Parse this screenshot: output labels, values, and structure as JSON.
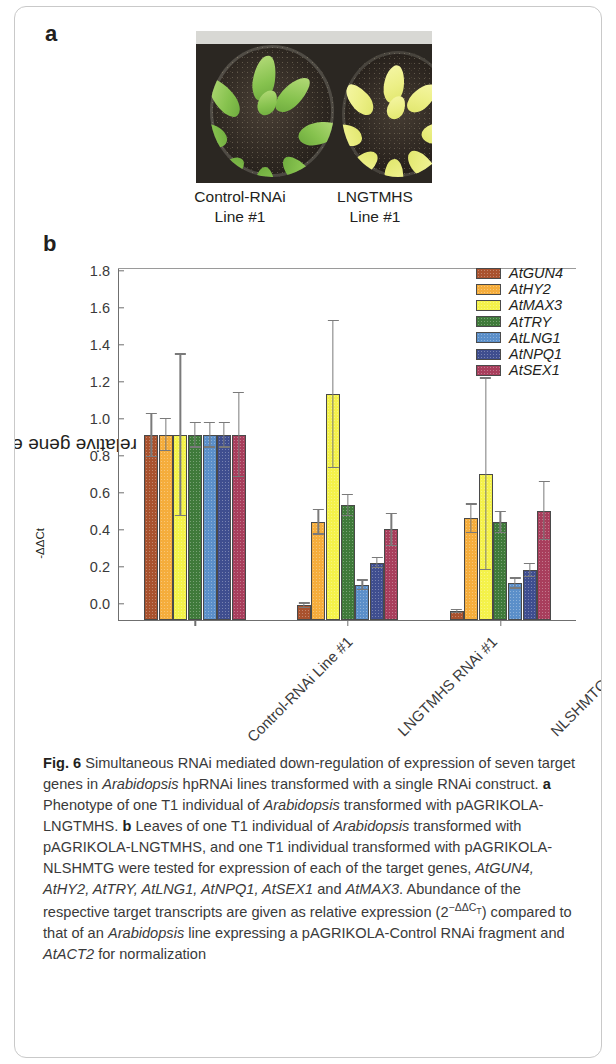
{
  "panels": {
    "a_letter": "a",
    "b_letter": "b"
  },
  "photo": {
    "left_label": "Control-RNAi\nLine #1",
    "left_label_line1": "Control-RNAi",
    "left_label_line2": "Line #1",
    "right_label_line1": "LNGTMHS",
    "right_label_line2": "Line #1"
  },
  "chart_data": {
    "type": "bar",
    "title": "",
    "xlabel": "",
    "ylabel": "relative gene expression [2-ΔΔCt]",
    "ylabel_base": "relative gene expression [2",
    "ylabel_exp": "-ΔΔCt",
    "ylabel_close": "]",
    "ylim": [
      0.0,
      1.9
    ],
    "yticks": [
      "0.0",
      "0.2",
      "0.4",
      "0.6",
      "0.8",
      "1.0",
      "1.2",
      "1.4",
      "1.6",
      "1.8"
    ],
    "ytick_values": [
      0.0,
      0.2,
      0.4,
      0.6,
      0.8,
      1.0,
      1.2,
      1.4,
      1.6,
      1.8
    ],
    "grid": false,
    "legend_position": "top-right",
    "categories": [
      "Control-RNAi Line #1",
      "LNGTMHS RNAi #1",
      "NLSHMTG RNAi #1"
    ],
    "series": [
      {
        "name": "AtGUN4",
        "color": "#a9522e",
        "values": [
          1.0,
          0.08,
          0.05
        ],
        "errors": [
          0.12,
          0.015,
          0.012
        ]
      },
      {
        "name": "AtHY2",
        "color": "#f5ad3c",
        "values": [
          1.0,
          0.53,
          0.55
        ],
        "errors": [
          0.09,
          0.07,
          0.08
        ]
      },
      {
        "name": "AtMAX3",
        "color": "#f4f24a",
        "values": [
          1.0,
          1.22,
          0.79
        ],
        "errors": [
          0.44,
          0.4,
          0.52
        ]
      },
      {
        "name": "AtTRY",
        "color": "#3f7a3a",
        "values": [
          1.0,
          0.62,
          0.53
        ],
        "errors": [
          0.07,
          0.06,
          0.06
        ]
      },
      {
        "name": "AtLNG1",
        "color": "#5b8fc9",
        "values": [
          1.0,
          0.19,
          0.2
        ],
        "errors": [
          0.07,
          0.03,
          0.03
        ]
      },
      {
        "name": "AtNPQ1",
        "color": "#3f4e8f",
        "values": [
          1.0,
          0.31,
          0.27
        ],
        "errors": [
          0.07,
          0.03,
          0.04
        ]
      },
      {
        "name": "AtSEX1",
        "color": "#a83e5c",
        "values": [
          1.0,
          0.49,
          0.59
        ],
        "errors": [
          0.23,
          0.09,
          0.16
        ]
      }
    ]
  },
  "caption": {
    "figure_number": "Fig. 6",
    "text_1": " Simultaneous RNAi mediated down-regulation of expression of seven target genes in ",
    "italic_1": "Arabidopsis",
    "text_2": " hpRNAi lines transformed with a single RNAi construct. ",
    "bold_a": "a",
    "text_3": " Phenotype of one T1 individual of ",
    "italic_2": "Arabidopsis",
    "text_4": " transformed with pAGRIKOLA-LNGTMHS. ",
    "bold_b": "b",
    "text_5": " Leaves of one T1 individual of ",
    "italic_3": "Arabidopsis",
    "text_6": " transformed with pAGRIKOLA-LNGTMHS, and one T1 individual transformed with pAGRIKOLA-NLSHMTG were tested for expression of each of the target genes, ",
    "italic_genes_1": "AtGUN4, AtHY2, AtTRY, AtLNG1, AtNPQ1, AtSEX1",
    "text_7": " and ",
    "italic_genes_2": "AtMAX3",
    "text_8": ". Abundance of the respective target transcripts are given as relative expression (2",
    "exponent": "−ΔΔC",
    "exponent_sub": "T",
    "text_9": ") compared to that of an ",
    "italic_4": "Arabidopsis",
    "text_10": " line expressing a pAGRIKOLA-Control RNAi fragment and ",
    "italic_5": "AtACT2",
    "text_11": " for normalization"
  }
}
